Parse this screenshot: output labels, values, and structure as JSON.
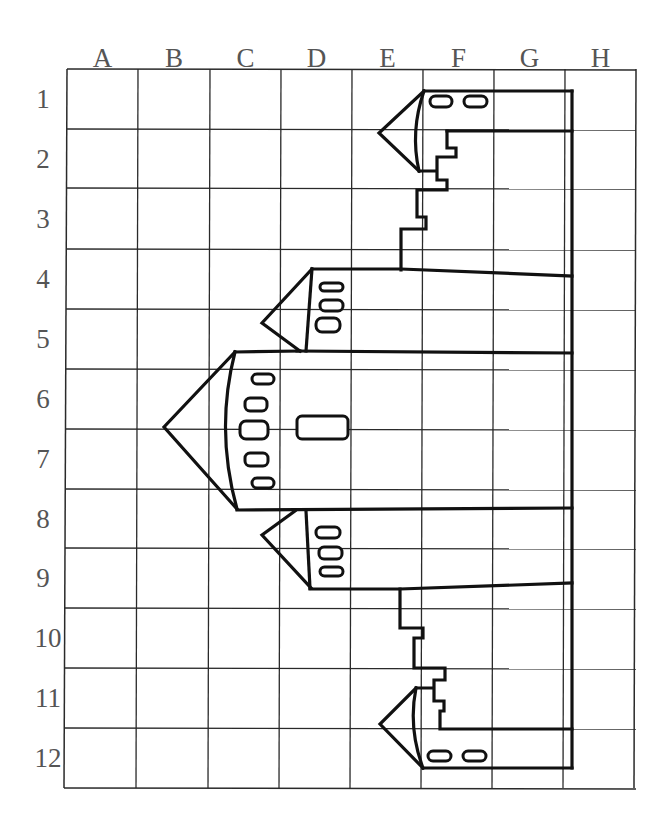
{
  "grid": {
    "columns": [
      "A",
      "B",
      "C",
      "D",
      "E",
      "F",
      "G",
      "H"
    ],
    "rows": [
      "1",
      "2",
      "3",
      "4",
      "5",
      "6",
      "7",
      "8",
      "9",
      "10",
      "11",
      "12"
    ],
    "x_lines": [
      67,
      138,
      210,
      281,
      352,
      423,
      494,
      565,
      636
    ],
    "y_lines": [
      69,
      129,
      188,
      249,
      309,
      369,
      429,
      489,
      548,
      608,
      668,
      728,
      788
    ],
    "line_color": "#2a2a2a",
    "label_color": "#555555"
  },
  "drawing": {
    "subject": "castle-towers",
    "ink_color": "#111111",
    "towers": [
      {
        "name": "top-tower",
        "cone_tip": [
          379,
          133
        ],
        "rows": "1-2"
      },
      {
        "name": "upper-middle-tower",
        "cone_tip": [
          262,
          323
        ],
        "rows": "4-5"
      },
      {
        "name": "main-tower",
        "cone_tip": [
          164,
          427
        ],
        "rows": "6-8"
      },
      {
        "name": "lower-middle-tower",
        "cone_tip": [
          262,
          535
        ],
        "rows": "8-9"
      },
      {
        "name": "bottom-tower",
        "cone_tip": [
          380,
          724
        ],
        "rows": "11-12"
      }
    ]
  }
}
